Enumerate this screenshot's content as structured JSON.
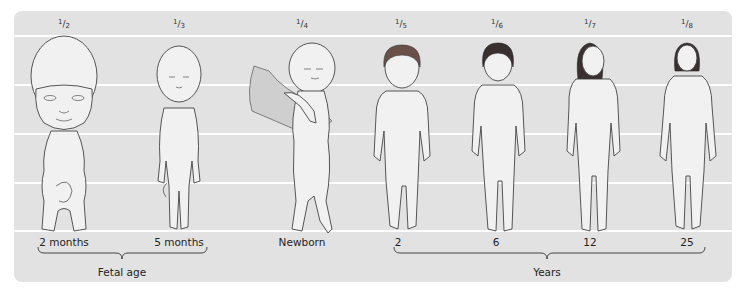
{
  "diagram": {
    "background_color": "#e2e2e2",
    "gridline_color": "#ffffff",
    "gridlines_y": [
      24,
      73,
      122,
      171,
      219
    ],
    "figures": [
      {
        "id": "fetus-2m",
        "ratio_num": "1",
        "ratio_den": "2",
        "head_ratio": "1/2",
        "age_label": "2 months",
        "x": 50
      },
      {
        "id": "fetus-5m",
        "ratio_num": "1",
        "ratio_den": "3",
        "head_ratio": "1/3",
        "age_label": "5 months",
        "x": 165
      },
      {
        "id": "newborn",
        "ratio_num": "1",
        "ratio_den": "4",
        "head_ratio": "1/4",
        "age_label": "Newborn",
        "x": 288
      },
      {
        "id": "child-2y",
        "ratio_num": "1",
        "ratio_den": "5",
        "head_ratio": "1/5",
        "age_label": "2",
        "x": 387
      },
      {
        "id": "child-6y",
        "ratio_num": "1",
        "ratio_den": "6",
        "head_ratio": "1/6",
        "age_label": "6",
        "x": 483
      },
      {
        "id": "teen-12y",
        "ratio_num": "1",
        "ratio_den": "7",
        "head_ratio": "1/7",
        "age_label": "12",
        "x": 576
      },
      {
        "id": "adult-25y",
        "ratio_num": "1",
        "ratio_den": "8",
        "head_ratio": "1/8",
        "age_label": "25",
        "x": 673
      }
    ],
    "groups": [
      {
        "label": "Fetal age",
        "x_start": 24,
        "x_end": 193,
        "center": 108
      },
      {
        "label": "Years",
        "x_start": 380,
        "x_end": 691,
        "center": 533
      }
    ]
  }
}
